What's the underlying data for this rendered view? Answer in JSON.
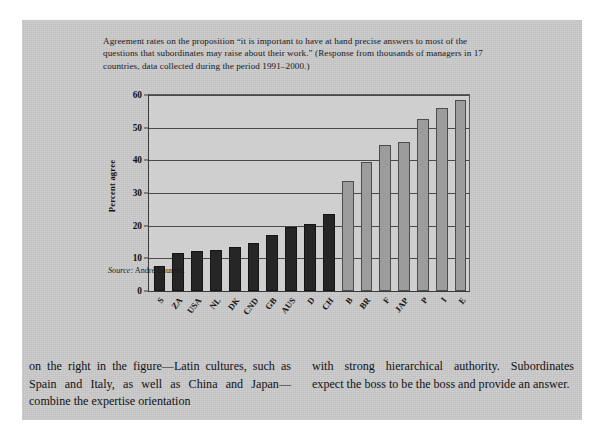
{
  "figure": {
    "caption": "Agreement rates on the proposition “it is important to have at hand precise answers to most of the questions that subordinates may raise about their work.” (Response from thousands of managers in 17 countries, data collected during the period 1991–2000.)",
    "source_word": "Source:",
    "source_text": " André Laurent."
  },
  "chart_data": {
    "type": "bar",
    "title": "",
    "xlabel": "",
    "ylabel": "Percent agree",
    "ylim": [
      0,
      60
    ],
    "yticks": [
      0,
      10,
      20,
      30,
      40,
      50,
      60
    ],
    "ytick_labels": [
      "0",
      "10",
      "20",
      "30",
      "40",
      "50",
      "60"
    ],
    "grid": true,
    "legend": "none",
    "categories": [
      "S",
      "ZA",
      "USA",
      "NL",
      "DK",
      "CND",
      "GB",
      "AUS",
      "D",
      "CH",
      "B",
      "BR",
      "F",
      "JAP",
      "P",
      "I",
      "E"
    ],
    "values": [
      7,
      11,
      11.5,
      12,
      13,
      14,
      16.5,
      19,
      20,
      23,
      33,
      39,
      44,
      45,
      52,
      55.5,
      58
    ],
    "colors": [
      "#262626",
      "#262626",
      "#262626",
      "#262626",
      "#262626",
      "#262626",
      "#262626",
      "#262626",
      "#262626",
      "#262626",
      "#9c9c9c",
      "#9c9c9c",
      "#9c9c9c",
      "#9c9c9c",
      "#9c9c9c",
      "#9c9c9c",
      "#9c9c9c"
    ]
  },
  "body": {
    "left_column": "on the right in the figure—Latin cultures, such as Spain and Italy, as well as China and Japan—combine the expertise orientation",
    "right_column": "with strong hierarchical authority. Subordinates expect the boss to be the boss and provide an answer."
  }
}
